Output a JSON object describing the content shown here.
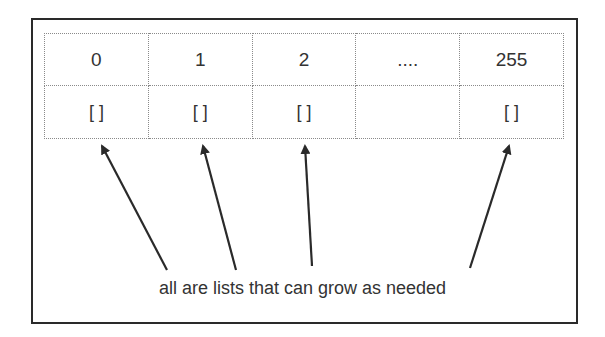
{
  "diagram": {
    "table": {
      "index_row": [
        "0",
        "1",
        "2",
        "....",
        "255"
      ],
      "value_row": [
        "[ ]",
        "[ ]",
        "[ ]",
        "",
        "[ ]"
      ]
    },
    "caption": "all are lists that can grow as needed",
    "colors": {
      "frame": "#2a2a2a",
      "grid": "#8a8a8a",
      "arrow": "#2a2a2a",
      "text": "#333333"
    }
  }
}
